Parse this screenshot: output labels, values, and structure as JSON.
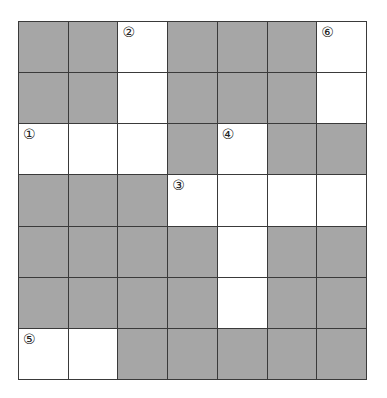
{
  "puzzle": {
    "type": "crossword",
    "rows": 7,
    "cols": 7,
    "colors": {
      "block": "#a6a6a6",
      "open": "#ffffff",
      "line": "#3a3a3a"
    },
    "layout": [
      "BBOBBBO",
      "BBOBBBO",
      "OOOBOBB",
      "BBBOOOO",
      "BBBBOBB",
      "BBBBOBB",
      "OOBBBBB"
    ],
    "clue_numbers": [
      {
        "row": 0,
        "col": 2,
        "label": "②"
      },
      {
        "row": 0,
        "col": 6,
        "label": "⑥"
      },
      {
        "row": 2,
        "col": 0,
        "label": "①"
      },
      {
        "row": 2,
        "col": 4,
        "label": "④"
      },
      {
        "row": 3,
        "col": 3,
        "label": "③"
      },
      {
        "row": 6,
        "col": 0,
        "label": "⑤"
      }
    ]
  }
}
